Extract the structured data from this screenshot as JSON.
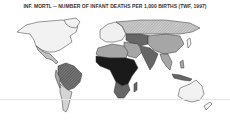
{
  "title": "INF. MORTL -- NUMBER OF INFANT DEATHS PER 1,000 BIRTHS (TWF, 1997)",
  "map": {
    "type": "choropleth",
    "subject": "Infant mortality rate (deaths per 1,000 births)",
    "source": "TWF, 1997",
    "shading": "grayscale, darker = higher infant mortality",
    "colors": {
      "lowest": "#f2f2f2",
      "low": "#d9d9d9",
      "medium": "#a6a6a6",
      "high": "#666666",
      "highest": "#1a1a1a",
      "outline": "#333333"
    },
    "regions": [
      {
        "name": "North America",
        "level": "lowest"
      },
      {
        "name": "Mexico / Central America",
        "level": "low"
      },
      {
        "name": "South America (Brazil, north)",
        "level": "high"
      },
      {
        "name": "South America (south cone)",
        "level": "low"
      },
      {
        "name": "Europe",
        "level": "lowest"
      },
      {
        "name": "Russia",
        "level": "low"
      },
      {
        "name": "North Africa",
        "level": "medium"
      },
      {
        "name": "Sub-Saharan Africa",
        "level": "highest"
      },
      {
        "name": "Southern Africa",
        "level": "high"
      },
      {
        "name": "Middle East",
        "level": "medium"
      },
      {
        "name": "Central / South Asia",
        "level": "high"
      },
      {
        "name": "China",
        "level": "medium"
      },
      {
        "name": "Southeast Asia",
        "level": "medium"
      },
      {
        "name": "Japan",
        "level": "lowest"
      },
      {
        "name": "Australia",
        "level": "lowest"
      },
      {
        "name": "New Zealand",
        "level": "lowest"
      }
    ]
  }
}
